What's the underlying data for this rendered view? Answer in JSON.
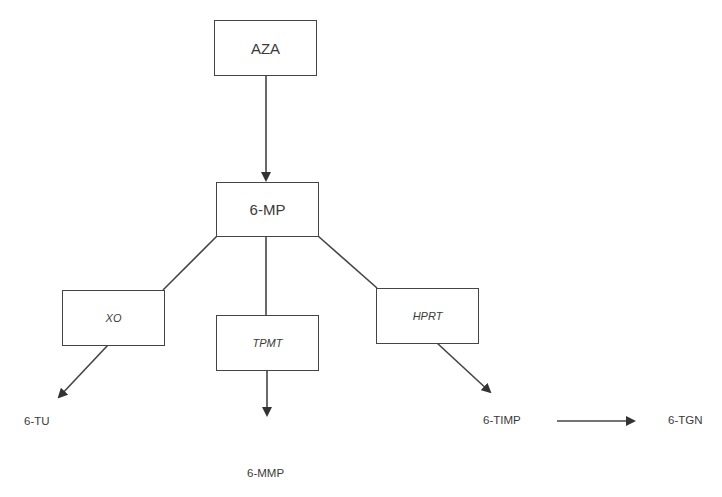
{
  "diagram": {
    "type": "metabolic-pathway",
    "colors": {
      "stroke": "#444444",
      "text": "#3a3a3a",
      "background": "#ffffff"
    },
    "nodes": {
      "aza": {
        "label": "AZA",
        "kind": "drug"
      },
      "mp": {
        "label": "6-MP",
        "kind": "drug"
      },
      "xo": {
        "label": "XO",
        "kind": "enzyme"
      },
      "tpmt": {
        "label": "TPMT",
        "kind": "enzyme"
      },
      "hprt": {
        "label": "HPRT",
        "kind": "enzyme"
      },
      "tu": {
        "label": "6-TU",
        "kind": "metabolite"
      },
      "mmp": {
        "label": "6-MMP",
        "kind": "metabolite"
      },
      "timp": {
        "label": "6-TIMP",
        "kind": "metabolite"
      },
      "tgn": {
        "label": "6-TGN",
        "kind": "metabolite"
      }
    },
    "edges": [
      {
        "from": "AZA",
        "to": "6-MP",
        "arrow": true
      },
      {
        "from": "6-MP",
        "to": "XO",
        "arrow": false
      },
      {
        "from": "6-MP",
        "to": "TPMT",
        "arrow": false
      },
      {
        "from": "6-MP",
        "to": "HPRT",
        "arrow": false
      },
      {
        "from": "XO",
        "to": "6-TU",
        "arrow": true
      },
      {
        "from": "TPMT",
        "to": "6-MMP",
        "arrow": true
      },
      {
        "from": "HPRT",
        "to": "6-TIMP",
        "arrow": true
      },
      {
        "from": "6-TIMP",
        "to": "6-TGN",
        "arrow": true
      }
    ]
  }
}
